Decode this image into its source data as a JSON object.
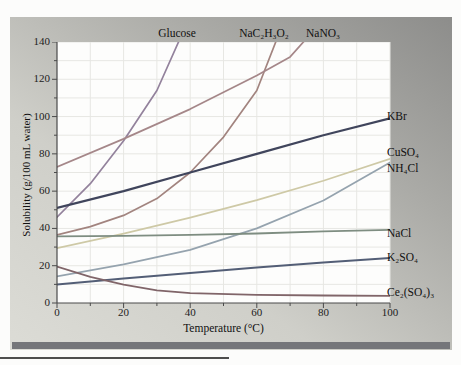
{
  "figure": {
    "x_axis_title": "Temperature (°C)",
    "y_axis_title": "Solubility (g/100 mL water)",
    "x_ticks": [
      0,
      20,
      40,
      60,
      80,
      100
    ],
    "y_ticks": [
      0,
      20,
      40,
      60,
      80,
      100,
      120,
      140
    ],
    "minor_tick_step": 10,
    "axis_color": "#4a4a4a",
    "grid_color": "#e7e7e3",
    "plot_bg_color": "#fdfdfc"
  },
  "chart_data": {
    "type": "line",
    "title": "",
    "xlabel": "Temperature (°C)",
    "ylabel": "Solubility (g/100 mL water)",
    "xlim": [
      0,
      100
    ],
    "ylim": [
      0,
      140
    ],
    "grid": true,
    "legend_position": "labels-on-figure",
    "series": [
      {
        "name": "glucose",
        "label": "Glucose",
        "label_position": "top",
        "color": "#93829c",
        "width": 1.7,
        "points": [
          [
            0,
            46
          ],
          [
            10,
            64
          ],
          [
            20,
            87
          ],
          [
            30,
            114
          ],
          [
            38,
            146
          ]
        ]
      },
      {
        "name": "sodium-acetate",
        "label": "NaC₂H₃O₂",
        "label_position": "top",
        "color": "#a2847f",
        "width": 1.7,
        "points": [
          [
            0,
            36.5
          ],
          [
            10,
            41
          ],
          [
            20,
            47
          ],
          [
            30,
            56
          ],
          [
            40,
            70
          ],
          [
            50,
            89
          ],
          [
            60,
            114
          ],
          [
            67,
            146
          ]
        ]
      },
      {
        "name": "sodium-nitrate",
        "label": "NaNO₃",
        "label_position": "top",
        "color": "#a58789",
        "width": 1.7,
        "points": [
          [
            0,
            73
          ],
          [
            20,
            88
          ],
          [
            40,
            104
          ],
          [
            60,
            122
          ],
          [
            70,
            132
          ],
          [
            77,
            146
          ]
        ]
      },
      {
        "name": "potassium-bromide",
        "label": "KBr",
        "label_position": "right",
        "color": "#40455c",
        "width": 2.2,
        "points": [
          [
            0,
            51
          ],
          [
            20,
            60
          ],
          [
            40,
            70
          ],
          [
            60,
            80
          ],
          [
            80,
            90
          ],
          [
            100,
            99
          ]
        ]
      },
      {
        "name": "copper-sulfate",
        "label": "CuSO₄",
        "label_position": "right",
        "color": "#95a3ae",
        "width": 1.7,
        "points": [
          [
            0,
            14.3
          ],
          [
            20,
            20.7
          ],
          [
            40,
            28.5
          ],
          [
            60,
            40
          ],
          [
            80,
            55
          ],
          [
            100,
            75.4
          ]
        ]
      },
      {
        "name": "ammonium-chloride",
        "label": "NH₄Cl",
        "label_position": "right",
        "color": "#cec9a6",
        "width": 1.7,
        "points": [
          [
            0,
            29.4
          ],
          [
            20,
            37.2
          ],
          [
            40,
            45.8
          ],
          [
            60,
            55.2
          ],
          [
            80,
            65.6
          ],
          [
            100,
            77.3
          ]
        ]
      },
      {
        "name": "sodium-chloride",
        "label": "NaCl",
        "label_position": "right",
        "color": "#7e8d81",
        "width": 1.8,
        "points": [
          [
            0,
            35.7
          ],
          [
            20,
            36
          ],
          [
            40,
            36.6
          ],
          [
            60,
            37.3
          ],
          [
            80,
            38.4
          ],
          [
            100,
            39.2
          ]
        ]
      },
      {
        "name": "potassium-sulfate",
        "label": "K₂SO₄",
        "label_position": "right",
        "color": "#535e76",
        "width": 2.0,
        "points": [
          [
            0,
            10
          ],
          [
            20,
            13.2
          ],
          [
            40,
            16.1
          ],
          [
            60,
            19
          ],
          [
            80,
            21.8
          ],
          [
            100,
            24.1
          ]
        ]
      },
      {
        "name": "cerium-sulfate",
        "label": "Ce₂(SO₄)₃",
        "label_position": "right",
        "color": "#806569",
        "width": 1.8,
        "points": [
          [
            0,
            19.5
          ],
          [
            10,
            14
          ],
          [
            20,
            9.8
          ],
          [
            30,
            6.8
          ],
          [
            40,
            5.3
          ],
          [
            60,
            4.4
          ],
          [
            80,
            4
          ],
          [
            100,
            3.8
          ]
        ]
      }
    ]
  }
}
